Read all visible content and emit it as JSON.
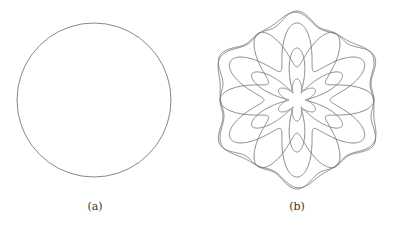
{
  "figure": {
    "panels": [
      {
        "id": "a",
        "caption": "(a)",
        "shape": "circle"
      },
      {
        "id": "b",
        "caption": "(b)",
        "shape": "rosette-hexagonal-interference-pattern"
      }
    ],
    "stroke_color": "#7a7a7a"
  }
}
